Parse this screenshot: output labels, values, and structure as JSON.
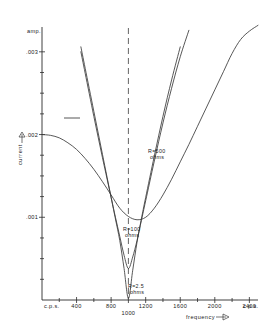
{
  "figure": {
    "background": "#ffffff",
    "ink_color": "#2b2b2b"
  },
  "axes": {
    "y_unit_label": "amp.",
    "y_axis_title": "current",
    "y_axis_arrow": "➤",
    "x_unit_label_left": "c.p.s.",
    "x_unit_label_right": "c.p.s.",
    "x_axis_title": "frequency",
    "x_axis_arrow": "➤"
  },
  "annotations": [
    {
      "id": "r500",
      "text_line1": "R=500",
      "text_line2": "ohms"
    },
    {
      "id": "r100",
      "text_line1": "R=100",
      "text_line2": "ohms"
    },
    {
      "id": "r25",
      "text_line1": "R=2.5",
      "text_line2": "ohms"
    }
  ],
  "chart_data": {
    "type": "line",
    "title": "",
    "xlabel": "frequency",
    "ylabel": "current",
    "x_unit": "c.p.s.",
    "y_unit": "amp.",
    "xlim": [
      0,
      2500
    ],
    "ylim": [
      0,
      0.0033
    ],
    "grid": false,
    "legend": "inline-annotations",
    "x_ticks": [
      400,
      800,
      1000,
      1200,
      1600,
      2000,
      2400
    ],
    "x_tick_labels": [
      "400",
      "800",
      "1000",
      "1200",
      "1600",
      "2000",
      "2400"
    ],
    "x_minor_ticks": [
      200,
      600,
      1400,
      1800,
      2200
    ],
    "y_ticks": [
      0.001,
      0.002,
      0.003
    ],
    "y_tick_labels": [
      ".001",
      ".002",
      ".003"
    ],
    "y_minor_ticks": [
      0.00025,
      0.0005,
      0.00075,
      0.00125,
      0.0015,
      0.00175,
      0.00225,
      0.0025,
      0.00275
    ],
    "resonance_frequency": 1000,
    "series": [
      {
        "name": "R=500 ohms",
        "resistance_ohms": 500,
        "minimum": {
          "x": 1080,
          "y": 0.00097
        },
        "x": [
          0,
          100,
          200,
          300,
          400,
          500,
          600,
          700,
          800,
          900,
          1000,
          1100,
          1200,
          1300,
          1400,
          1500,
          1600,
          1700,
          1800,
          1900,
          2000,
          2100,
          2200,
          2300,
          2400,
          2500
        ],
        "y": [
          0.002,
          0.00199,
          0.00196,
          0.0019,
          0.00182,
          0.00171,
          0.00158,
          0.00143,
          0.00127,
          0.00111,
          0.00101,
          0.00097,
          0.001,
          0.00111,
          0.00127,
          0.00146,
          0.00167,
          0.00188,
          0.0021,
          0.00232,
          0.00254,
          0.00276,
          0.00298,
          0.00315,
          0.00325,
          0.00332
        ]
      },
      {
        "name": "R=100 ohms",
        "resistance_ohms": 100,
        "minimum": {
          "x": 1000,
          "y": 0.00038
        },
        "x": [
          380,
          450,
          500,
          600,
          700,
          800,
          850,
          900,
          950,
          1000,
          1050,
          1100,
          1150,
          1200,
          1300,
          1400,
          1500,
          1600,
          1700,
          1800,
          1900,
          2000,
          2100,
          2200,
          2300,
          2400,
          2500
        ],
        "y": [
          0.0034,
          0.003,
          0.00274,
          0.00222,
          0.00172,
          0.00124,
          0.001,
          0.00077,
          0.00054,
          0.00038,
          0.00052,
          0.00072,
          0.00096,
          0.0012,
          0.00168,
          0.00214,
          0.00256,
          0.00294,
          0.00326,
          0.00352,
          0.00374,
          0.00392,
          0.00406,
          0.00418,
          0.00427,
          0.00434,
          0.0044
        ]
      },
      {
        "name": "R=2.5 ohms",
        "resistance_ohms": 2.5,
        "minimum": {
          "x": 1000,
          "y": 2e-05
        },
        "x": [
          400,
          450,
          500,
          600,
          700,
          800,
          850,
          900,
          950,
          1000,
          1050,
          1100,
          1150,
          1200,
          1300,
          1400,
          1500,
          1600,
          1700,
          1800,
          1900,
          2000,
          2100,
          2200,
          2300,
          2400,
          2500
        ],
        "y": [
          0.0034,
          0.00306,
          0.0028,
          0.00228,
          0.00176,
          0.00124,
          0.00098,
          0.00072,
          0.00038,
          2e-05,
          0.00036,
          0.0007,
          0.00098,
          0.00124,
          0.00174,
          0.00222,
          0.00266,
          0.00306,
          0.0034,
          0.00368,
          0.00392,
          0.00412,
          0.00428,
          0.00441,
          0.00452,
          0.00461,
          0.00468
        ]
      }
    ]
  }
}
